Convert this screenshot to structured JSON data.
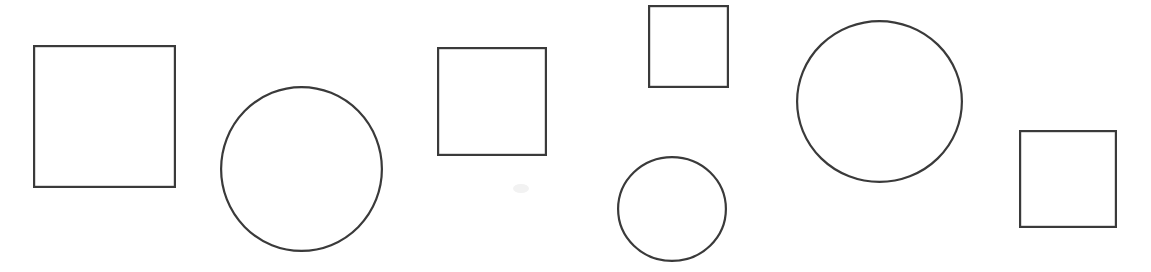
{
  "canvas": {
    "width": 1151,
    "height": 272,
    "background_color": "#ffffff",
    "title": "Geometric shapes row"
  },
  "style": {
    "stroke_color": "#3a3a3a",
    "stroke_width": 2.2,
    "fill": "none",
    "smudge_color": "#f2f2f2"
  },
  "shapes": [
    {
      "id": "square-1",
      "kind": "square",
      "label": "Square 1",
      "x": 33,
      "y": 45,
      "width": 143,
      "height": 143,
      "center_x": 104.5,
      "center_y": 116.5
    },
    {
      "id": "circle-1",
      "kind": "circle",
      "label": "Circle 1",
      "center_x": 301.5,
      "center_y": 169,
      "radius_x": 81.5,
      "radius_y": 83,
      "diameter": 165
    },
    {
      "id": "square-2",
      "kind": "square",
      "label": "Square 2",
      "x": 437,
      "y": 47,
      "width": 110,
      "height": 109,
      "center_x": 492,
      "center_y": 101.5
    },
    {
      "id": "square-3",
      "kind": "square",
      "label": "Square 3",
      "x": 648,
      "y": 5,
      "width": 81,
      "height": 83,
      "center_x": 688.5,
      "center_y": 46.5
    },
    {
      "id": "circle-2",
      "kind": "circle",
      "label": "Circle 2",
      "center_x": 672,
      "center_y": 209,
      "radius_x": 55,
      "radius_y": 53,
      "diameter": 110
    },
    {
      "id": "circle-3",
      "kind": "circle",
      "label": "Circle 3",
      "center_x": 879.5,
      "center_y": 101.5,
      "radius_x": 83.5,
      "radius_y": 81.5,
      "diameter": 167
    },
    {
      "id": "square-4",
      "kind": "square",
      "label": "Square 4",
      "x": 1019,
      "y": 130,
      "width": 98,
      "height": 98,
      "center_x": 1068,
      "center_y": 179
    }
  ],
  "marks": [
    {
      "id": "smudge-1",
      "label": "faint gray smudge",
      "x": 513,
      "y": 184
    }
  ]
}
